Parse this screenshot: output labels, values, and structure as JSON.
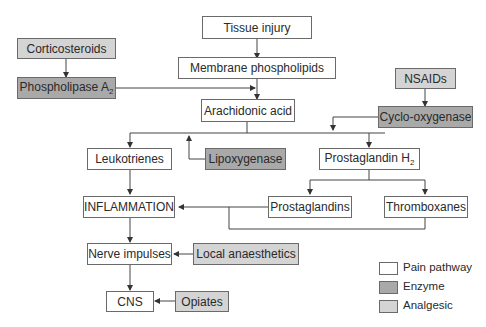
{
  "diagram": {
    "nodes": {
      "tissue_injury": "Tissue injury",
      "membrane_phospholipids": "Membrane phospholipids",
      "arachidonic_acid": "Arachidonic acid",
      "corticosteroids": "Corticosteroids",
      "phospholipase_a2": "Phospholipase A",
      "phospholipase_a2_sub": "2",
      "nsaids": "NSAIDs",
      "cyclo_oxygenase": "Cyclo-oxygenase",
      "leukotrienes": "Leukotrienes",
      "lipoxygenase": "Lipoxygenase",
      "prostaglandin_h2": "Prostaglandin H",
      "prostaglandin_h2_sub": "2",
      "inflammation": "INFLAMMATION",
      "prostaglandins": "Prostaglandins",
      "thromboxanes": "Thromboxanes",
      "nerve_impulses": "Nerve impulses",
      "local_anaesthetics": "Local anaesthetics",
      "cns": "CNS",
      "opiates": "Opiates"
    },
    "legend": [
      {
        "label": "Pain pathway",
        "color": "#ffffff"
      },
      {
        "label": "Enzyme",
        "color": "#a9a9a9"
      },
      {
        "label": "Analgesic",
        "color": "#d4d4d4"
      }
    ],
    "edges": [
      [
        "tissue_injury",
        "membrane_phospholipids"
      ],
      [
        "membrane_phospholipids",
        "arachidonic_acid"
      ],
      [
        "corticosteroids",
        "phospholipase_a2"
      ],
      [
        "phospholipase_a2",
        "membrane_phospholipids-to-arachidonic_acid"
      ],
      [
        "nsaids",
        "cyclo_oxygenase"
      ],
      [
        "cyclo_oxygenase",
        "arachidonic_acid-to-prostaglandin_h2"
      ],
      [
        "arachidonic_acid",
        "leukotrienes"
      ],
      [
        "arachidonic_acid",
        "prostaglandin_h2"
      ],
      [
        "lipoxygenase",
        "arachidonic_acid-to-leukotrienes"
      ],
      [
        "prostaglandin_h2",
        "prostaglandins"
      ],
      [
        "prostaglandin_h2",
        "thromboxanes"
      ],
      [
        "leukotrienes",
        "inflammation"
      ],
      [
        "prostaglandins",
        "inflammation"
      ],
      [
        "thromboxanes",
        "inflammation"
      ],
      [
        "inflammation",
        "nerve_impulses"
      ],
      [
        "local_anaesthetics",
        "nerve_impulses"
      ],
      [
        "nerve_impulses",
        "cns"
      ],
      [
        "opiates",
        "cns"
      ]
    ]
  }
}
